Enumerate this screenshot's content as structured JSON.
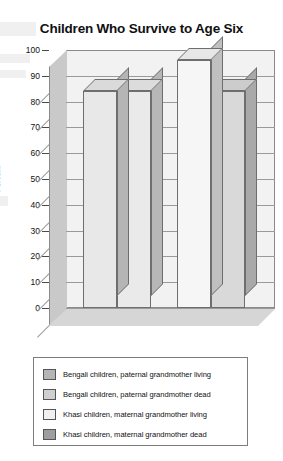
{
  "chart_data": {
    "type": "bar",
    "title": "Children Who Survive to Age Six",
    "xlabel": "",
    "ylabel": "Percent",
    "ylim": [
      0,
      100
    ],
    "ytick_step": 10,
    "yticks": [
      "100",
      "90",
      "80",
      "70",
      "60",
      "50",
      "40",
      "30",
      "20",
      "10",
      "0"
    ],
    "grid": true,
    "legend_position": "below-plot",
    "style": "3d-column",
    "categories": [
      "Bengali children, paternal grandmother living",
      "Bengali children, paternal grandmother dead",
      "Khasi children, maternal grandmother living",
      "Khasi children, maternal grandmother dead"
    ],
    "values": [
      84,
      84,
      96,
      84
    ],
    "series": [
      {
        "name": "Bengali children, paternal grandmother living",
        "value": 84,
        "color": "#e8e8e8",
        "legend_swatch_color": "#b5b5b5"
      },
      {
        "name": "Bengali children, paternal grandmother dead",
        "value": 84,
        "color": "#eaeaea",
        "legend_swatch_color": "#cfcfcf"
      },
      {
        "name": "Khasi children, maternal grandmother living",
        "value": 96,
        "color": "#f6f6f6",
        "legend_swatch_color": "#f0f0f0"
      },
      {
        "name": "Khasi children, maternal grandmother dead",
        "value": 84,
        "color": "#d9d9d9",
        "legend_swatch_color": "#9e9e9e"
      }
    ]
  },
  "colors": {
    "plot_background": "#f2f2f2",
    "floor": "#d6d6d6",
    "left_wall": "#c9c9c9",
    "gridline": "#9a9a9a",
    "frame": "#8a8a8a",
    "text": "#111111",
    "legend_background": "#ffffff",
    "legend_border": "#7d7d7d"
  }
}
